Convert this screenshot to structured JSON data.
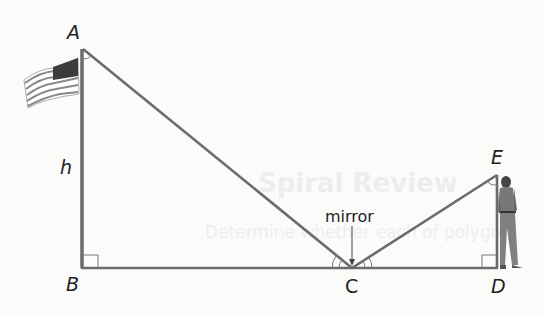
{
  "figure": {
    "type": "indirect-measurement-mirror",
    "points": {
      "A": {
        "label": "A",
        "x": 83,
        "y": 49
      },
      "B": {
        "label": "B",
        "x": 82,
        "y": 267
      },
      "C": {
        "label": "C",
        "x": 352,
        "y": 268
      },
      "D": {
        "label": "D",
        "x": 497,
        "y": 268
      },
      "E": {
        "label": "E",
        "x": 497,
        "y": 175
      }
    },
    "height_label": "h",
    "mirror_label": "mirror",
    "objects": [
      "flagpole-with-us-flag",
      "standing-person"
    ],
    "right_angles": [
      "B",
      "D"
    ],
    "congruent_angles": [
      "ACB",
      "ECD"
    ],
    "marked_angles": [
      "BAC",
      "DEC"
    ],
    "colors": {
      "line": "#6b6b6b",
      "text": "#222222",
      "flag_stripe": "#7a7a7a",
      "flag_canton": "#3c3c3c"
    }
  },
  "bleed_through": {
    "heading": "Spiral Review",
    "line": "Determine whether each of polygon"
  }
}
